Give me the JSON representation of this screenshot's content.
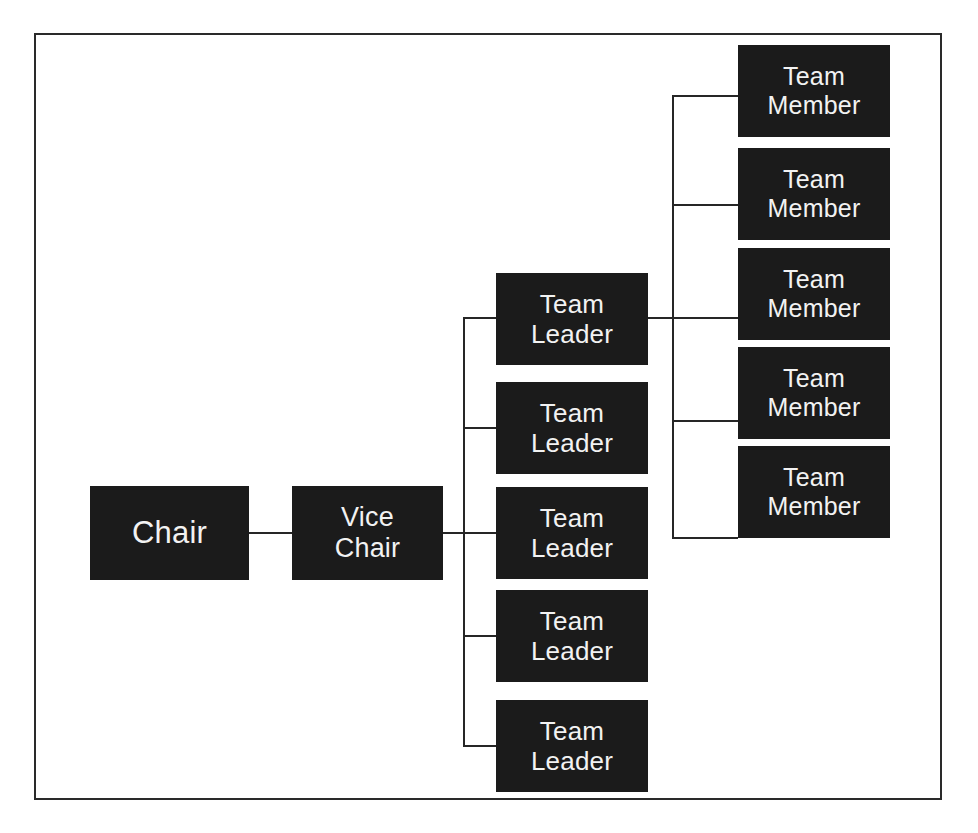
{
  "diagram": {
    "type": "organizational-chart",
    "orientation": "left-to-right",
    "colors": {
      "node_fill": "#1b1b1b",
      "node_text": "#f2f2f2",
      "connector": "#262626",
      "frame_border": "#2a2a2a",
      "background": "#ffffff"
    },
    "levels": [
      {
        "level": 1,
        "label": "Chair"
      },
      {
        "level": 2,
        "label": "Vice Chair"
      },
      {
        "level": 3,
        "label": "Team Leader"
      },
      {
        "level": 4,
        "label": "Team Member"
      }
    ],
    "nodes": {
      "chair": {
        "label": "Chair"
      },
      "vice_chair": {
        "label": "Vice\nChair"
      },
      "team_leaders": [
        {
          "label": "Team\nLeader"
        },
        {
          "label": "Team\nLeader"
        },
        {
          "label": "Team\nLeader"
        },
        {
          "label": "Team\nLeader"
        },
        {
          "label": "Team\nLeader"
        }
      ],
      "team_members": [
        {
          "label": "Team\nMember"
        },
        {
          "label": "Team\nMember"
        },
        {
          "label": "Team\nMember"
        },
        {
          "label": "Team\nMember"
        },
        {
          "label": "Team\nMember"
        }
      ]
    },
    "counts": {
      "chair": 1,
      "vice_chair": 1,
      "team_leaders": 5,
      "team_members": 5
    }
  }
}
